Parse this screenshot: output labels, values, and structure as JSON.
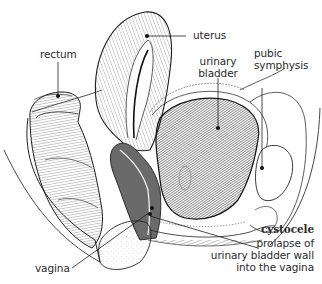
{
  "diagram": {
    "labels": {
      "rectum": "rectum",
      "uterus": "uterus",
      "urinary_bladder_line1": "urinary",
      "urinary_bladder_line2": "bladder",
      "pubic_symphysis_line1": "pubic",
      "pubic_symphysis_line2": "symphysis",
      "vagina": "vagina",
      "cystocele_title": "cystocele",
      "cystocele_desc_line1": "prolapse of",
      "cystocele_desc_line2": "urinary bladder wall",
      "cystocele_desc_line3": "into the vagina"
    },
    "colors": {
      "ink": "#1e1e1e",
      "text": "#2a2a2a",
      "background": "#ffffff",
      "bladder_fill": "#3a3a3a",
      "bone_fill": "#f4f4f4"
    }
  }
}
